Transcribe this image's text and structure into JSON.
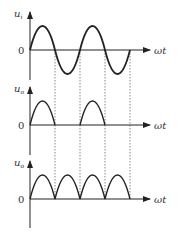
{
  "panels": [
    {
      "id": "input",
      "ylabel": "u",
      "ysub": "i",
      "origin": "0",
      "xlabel": "ωt",
      "waveform": "full sine"
    },
    {
      "id": "output-half",
      "ylabel": "u",
      "ysub": "o",
      "origin": "0",
      "xlabel": "ωt",
      "waveform": "half-wave rectified"
    },
    {
      "id": "output-full",
      "ylabel": "u",
      "ysub": "o",
      "origin": "0",
      "xlabel": "ωt",
      "waveform": "full-wave rectified"
    }
  ],
  "colors": {
    "stroke": "#222222",
    "dash": "#555555"
  }
}
